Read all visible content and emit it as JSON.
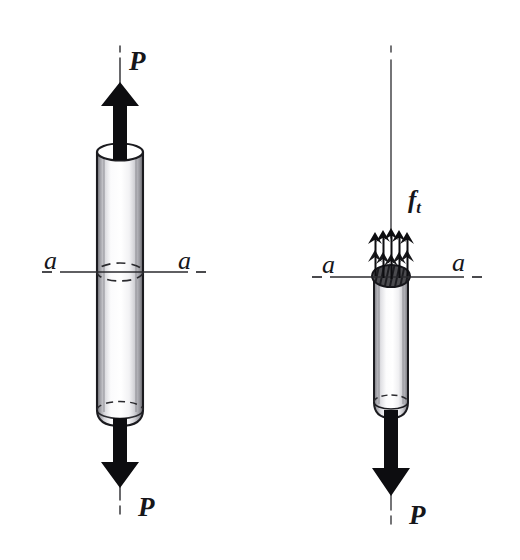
{
  "figure": {
    "type": "engineering-free-body-diagram",
    "background_color": "#ffffff",
    "ink_color": "#16161a",
    "panels": [
      {
        "id": "left",
        "name": "intact-bar-panel",
        "description": "Cylindrical bar loaded in tension by equal and opposite forces P, with cutting plane a-a marked at mid-height",
        "labels": {
          "load_top": "P",
          "load_bottom": "P",
          "section_left": "a",
          "section_right": "a"
        },
        "arrows": [
          {
            "name": "load-arrow-top",
            "label": "P",
            "direction": "up"
          },
          {
            "name": "load-arrow-bottom",
            "label": "P",
            "direction": "down"
          }
        ],
        "section_line_label": "a-a"
      },
      {
        "id": "right",
        "name": "cut-bar-panel",
        "description": "Lower half of the bar after cutting at section a-a, showing the distributed internal tensile stress f_t acting on the exposed cross-section, balanced by the applied load P",
        "labels": {
          "stress": "f",
          "stress_subscript": "t",
          "load_bottom": "P",
          "section_left": "a",
          "section_right": "a"
        },
        "arrows": [
          {
            "name": "stress-arrow-1",
            "label": "f_t",
            "direction": "up"
          },
          {
            "name": "stress-arrow-2",
            "label": "f_t",
            "direction": "up"
          },
          {
            "name": "stress-arrow-3",
            "label": "f_t",
            "direction": "up"
          },
          {
            "name": "stress-arrow-4",
            "label": "f_t",
            "direction": "up"
          },
          {
            "name": "stress-arrow-5",
            "label": "f_t",
            "direction": "up"
          },
          {
            "name": "load-arrow-bottom",
            "label": "P",
            "direction": "down"
          }
        ],
        "stress_arrow_count": 5,
        "section_line_label": "a-a"
      }
    ]
  },
  "labels": {
    "left_top_P": "P",
    "left_bottom_P": "P",
    "left_a_left": "a",
    "left_a_right": "a",
    "right_ft_main": "f",
    "right_ft_sub": "t",
    "right_bottom_P": "P",
    "right_a_left": "a",
    "right_a_right": "a"
  }
}
